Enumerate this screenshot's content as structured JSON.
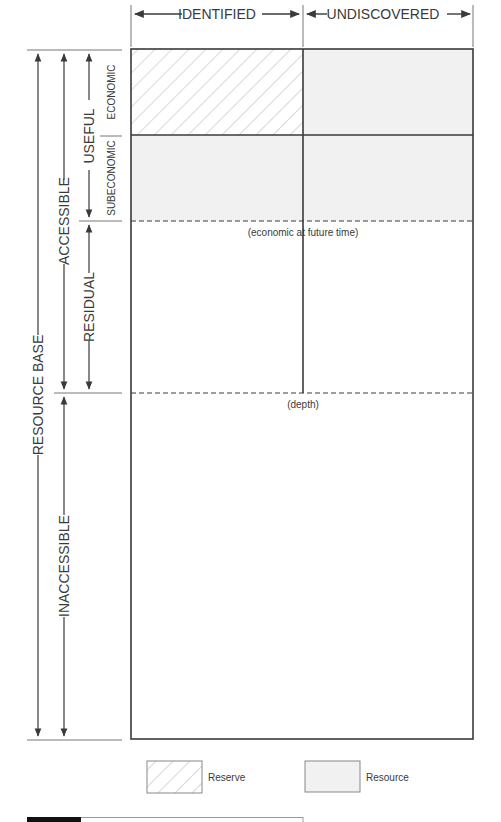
{
  "diagram": {
    "columns": {
      "identified": "IDENTIFIED",
      "undiscovered": "UNDISCOVERED"
    },
    "rows": {
      "economic": "ECONOMIC",
      "subeconomic": "SUBECONOMIC",
      "useful": "USEFUL",
      "residual": "RESIDUAL",
      "accessible": "ACCESSIBLE",
      "inaccessible": "INACCESSIBLE",
      "resource_base": "RESOURCE BASE"
    },
    "annotations": {
      "future_time": "(economic at future time)",
      "depth": "(depth)"
    },
    "legend": {
      "reserve": "Reserve",
      "resource": "Resource"
    },
    "colors": {
      "line": "#3a3a3a",
      "resource_fill": "#f1f1f1",
      "hatch": "#b5b5b5",
      "footer_bar": "#111111"
    }
  }
}
